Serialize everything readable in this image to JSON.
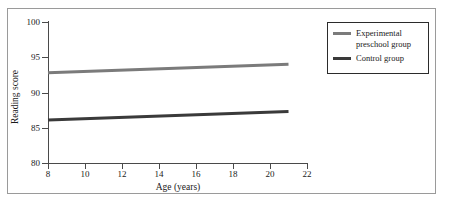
{
  "chart_data": {
    "type": "line",
    "title": "",
    "xlabel": "Age (years)",
    "ylabel": "Reading score",
    "xlim": [
      8,
      22
    ],
    "ylim": [
      80,
      100
    ],
    "xticks": [
      8,
      10,
      12,
      14,
      16,
      18,
      20,
      22
    ],
    "yticks": [
      80,
      85,
      90,
      95,
      100
    ],
    "grid": false,
    "legend_position": "top-right",
    "x": [
      8,
      21
    ],
    "series": [
      {
        "name": "Experimental\npreschool group",
        "color": "#7b7b7b",
        "values": [
          92.8,
          94.0
        ]
      },
      {
        "name": "Control group",
        "color": "#3a3a3a",
        "values": [
          86.1,
          87.3
        ]
      }
    ]
  },
  "axes": {
    "x_title": "Age (years)",
    "y_title": "Reading score",
    "x_tick_labels": [
      "8",
      "10",
      "12",
      "14",
      "16",
      "18",
      "20",
      "22"
    ],
    "y_tick_labels": [
      "80",
      "85",
      "90",
      "95",
      "100"
    ]
  },
  "legend": {
    "entries": [
      {
        "label": "Experimental\npreschool group",
        "color": "#7b7b7b"
      },
      {
        "label": "Control group",
        "color": "#3a3a3a"
      }
    ]
  },
  "colors": {
    "background": "#ffffff",
    "frame": "#9a9a9a",
    "axis": "#4a4a4a",
    "text": "#1a1a1a",
    "legend_border": "#2b2b2b",
    "experimental_line": "#7b7b7b",
    "control_line": "#3a3a3a"
  }
}
